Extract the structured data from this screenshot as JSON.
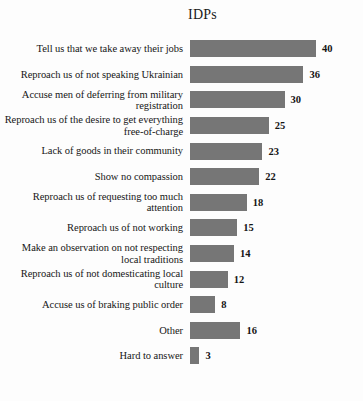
{
  "chart_data": {
    "type": "bar",
    "orientation": "horizontal",
    "title": "IDPs",
    "xlabel": "",
    "ylabel": "",
    "grid": false,
    "legend": null,
    "xlim": [
      0,
      40
    ],
    "value_labels_shown": true,
    "bar_color": "#767676",
    "background_color": "#fdfdfd",
    "categories": [
      "Tell us that we take away their jobs",
      "Reproach us of not speaking Ukrainian",
      "Accuse men of deferring from military registration",
      "Reproach us of the desire to get everything free-of-charge",
      "Lack of goods in their community",
      "Show no compassion",
      "Reproach us of requesting too much attention",
      "Reproach us of not working",
      "Make an observation on not respecting local traditions",
      "Reproach us of not domesticating local culture",
      "Accuse us of braking public order",
      "Other",
      "Hard to answer"
    ],
    "values": [
      40,
      36,
      30,
      25,
      23,
      22,
      18,
      15,
      14,
      12,
      8,
      16,
      3
    ]
  }
}
